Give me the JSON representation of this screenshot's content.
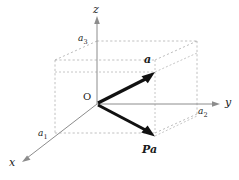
{
  "figure": {
    "background_color": "#ffffff",
    "axis_color": "#8c8c8c",
    "dash_color": "#b0b0b0",
    "vector_color": "#111111"
  },
  "axes": {
    "x_label": "x",
    "y_label": "y",
    "z_label": "z"
  },
  "components": {
    "a1_label": "a",
    "a1_sub": "1",
    "a2_label": "a",
    "a2_sub": "2",
    "a3_label": "a",
    "a3_sub": "3"
  },
  "points": {
    "origin_label": "O"
  },
  "vectors": {
    "a_label": "a",
    "pa_label": "Pa"
  }
}
